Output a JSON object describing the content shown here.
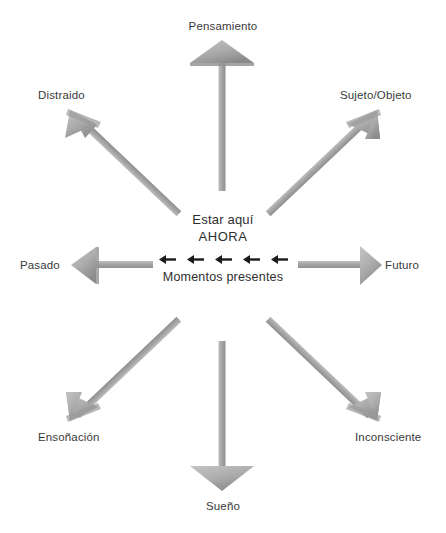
{
  "diagram": {
    "title_center": {
      "line1": "Estar aquí",
      "line2": "AHORA",
      "subtitle": "Momentos presentes",
      "mini_arrow_count": 5,
      "mini_arrow_direction": "left",
      "mini_arrow_color": "#1a1a1a"
    },
    "arrow_color": "#a9a9a9",
    "arrow_shade_color": "#8d8d8d",
    "label_color": "#3a3a3a",
    "nodes": [
      {
        "id": "pensamiento",
        "label": "Pensamiento",
        "direction": "up"
      },
      {
        "id": "sujeto-objeto",
        "label": "Sujeto/Objeto",
        "direction": "up-right"
      },
      {
        "id": "futuro",
        "label": "Futuro",
        "direction": "right"
      },
      {
        "id": "inconsciente",
        "label": "Inconsciente",
        "direction": "down-right"
      },
      {
        "id": "sueno",
        "label": "Sueño",
        "direction": "down"
      },
      {
        "id": "ensonacion",
        "label": "Ensoñación",
        "direction": "down-left"
      },
      {
        "id": "pasado",
        "label": "Pasado",
        "direction": "left"
      },
      {
        "id": "distraido",
        "label": "Distraido",
        "direction": "up-left"
      }
    ]
  }
}
